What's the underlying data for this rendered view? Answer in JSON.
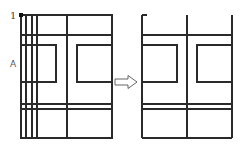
{
  "diagram": {
    "type": "before-after-floor-plan",
    "labels": {
      "point_label": "1",
      "side_label": "A"
    },
    "colors": {
      "line": "#2a2a2a",
      "background": "#ffffff",
      "arrow_outline": "#555555"
    },
    "before": {
      "outer": {
        "x1": 21,
        "y1": 15,
        "x2": 112,
        "y2": 138
      },
      "verticals": [
        26,
        32,
        37,
        67
      ],
      "horizontals": [
        35,
        45,
        104,
        109
      ],
      "inner_squares": [
        {
          "x1": 21,
          "y1": 45,
          "x2": 56,
          "y2": 82
        },
        {
          "x1": 77,
          "y1": 45,
          "x2": 112,
          "y2": 82
        }
      ],
      "marker_point": {
        "x": 21,
        "y": 15
      }
    },
    "arrow": {
      "x1": 115,
      "x2": 137,
      "y": 82,
      "direction": "right"
    },
    "after": {
      "left": 142,
      "right": 232,
      "top": 15,
      "bottom": 138,
      "center_vertical": 187,
      "top_tick_end": 147,
      "horizontals": [
        35,
        104,
        109
      ],
      "inner_squares": [
        {
          "x1": 142,
          "y1": 45,
          "x2": 177,
          "y2": 82
        },
        {
          "x1": 197,
          "y1": 45,
          "x2": 232,
          "y2": 82
        }
      ]
    }
  }
}
